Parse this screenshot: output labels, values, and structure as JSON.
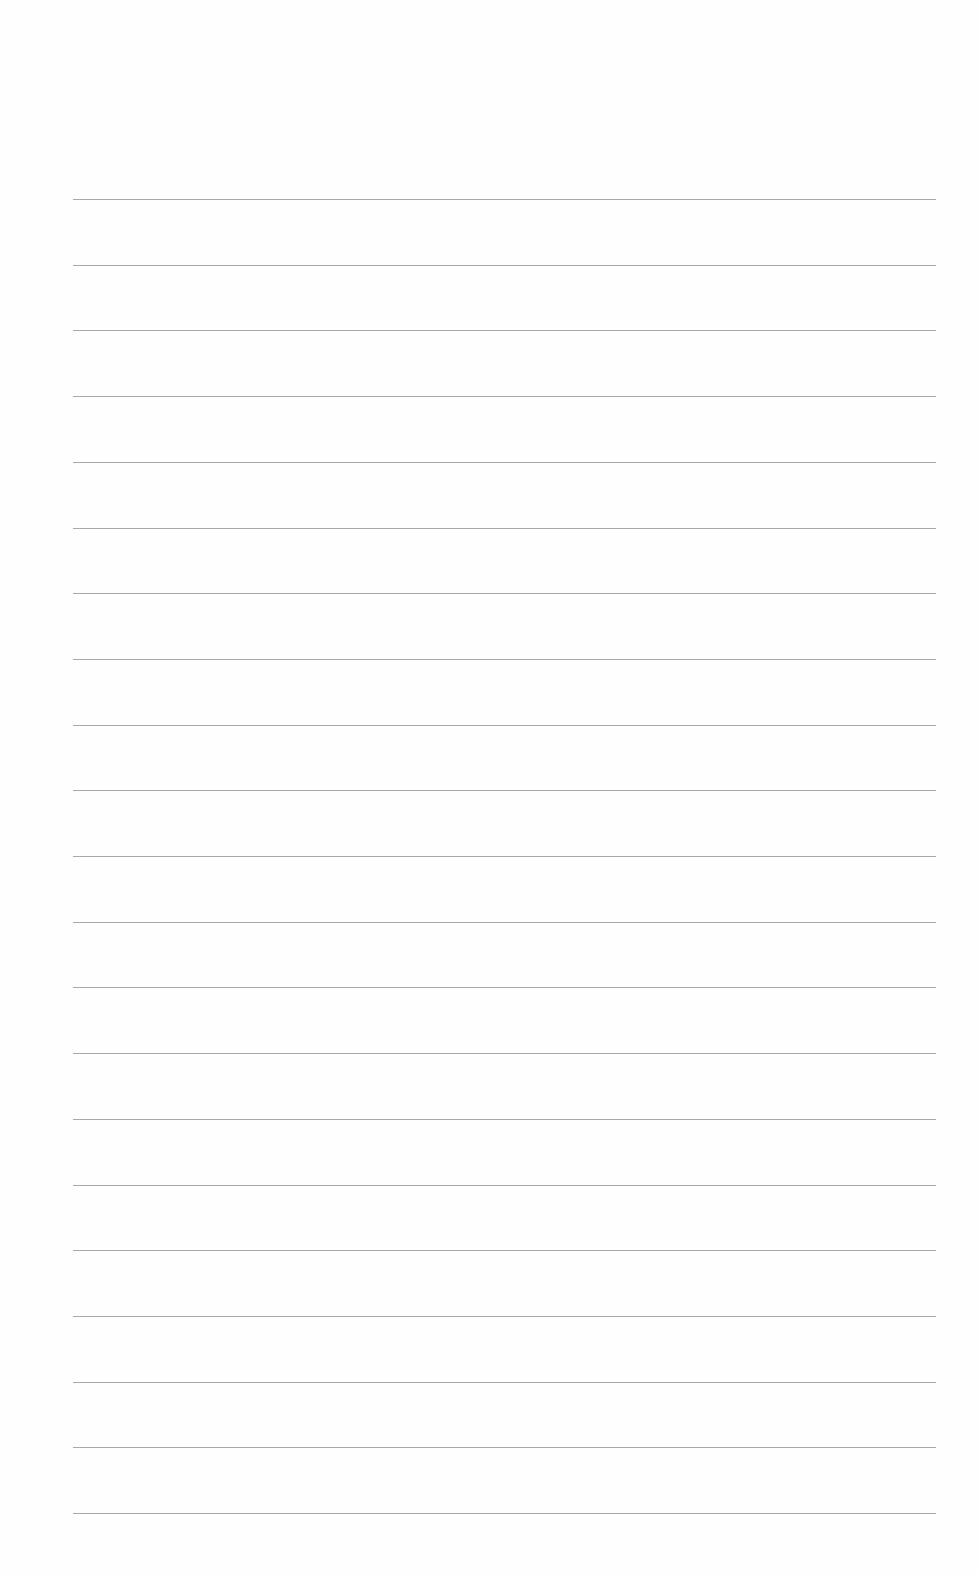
{
  "page": {
    "type": "blank-lined-paper",
    "line_count": 21,
    "line_color": "#9a9a9a",
    "background_color": "#fefefe",
    "first_line_y": 199,
    "line_spacing": 65.7,
    "line_left": 73,
    "line_right": 936
  }
}
